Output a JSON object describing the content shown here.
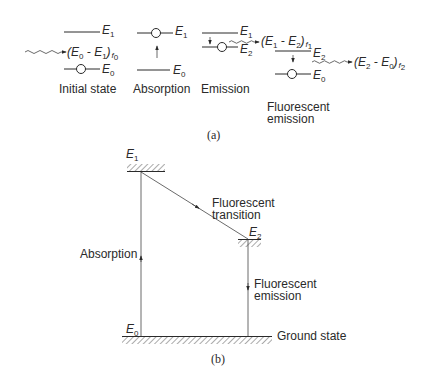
{
  "figure": {
    "panel_a": {
      "caption": "(a)",
      "stages": [
        {
          "label": "Initial state",
          "upper_level": "E",
          "upper_sub": "1",
          "lower_level": "E",
          "lower_sub": "0",
          "photon_label": {
            "open": "(",
            "e1": "E",
            "e1_sub": "0",
            "minus": " - ",
            "e2": "E",
            "e2_sub": "1",
            "close": ")",
            "f": "f",
            "f_sub": "0"
          }
        },
        {
          "label": "Absorption",
          "upper_level": "E",
          "upper_sub": "1",
          "lower_level": "E",
          "lower_sub": "0"
        },
        {
          "label": "Emission",
          "upper_level": "E",
          "upper_sub": "1",
          "lower_level": "E",
          "lower_sub": "2",
          "photon_label": {
            "open": "(",
            "e1": "E",
            "e1_sub": "1",
            "minus": " - ",
            "e2": "E",
            "e2_sub": "2",
            "close": ")",
            "f": "f",
            "f_sub": "1"
          }
        },
        {
          "label_line1": "Fluorescent",
          "label_line2": "emission",
          "upper_level": "E",
          "upper_sub": "2",
          "lower_level": "E",
          "lower_sub": "0",
          "photon_label": {
            "open": "(",
            "e1": "E",
            "e1_sub": "2",
            "minus": " - ",
            "e2": "E",
            "e2_sub": "0",
            "close": ")",
            "f": "f",
            "f_sub": "2"
          }
        }
      ]
    },
    "panel_b": {
      "caption": "(b)",
      "levels": {
        "e1": {
          "name": "E",
          "sub": "1"
        },
        "e2": {
          "name": "E",
          "sub": "2"
        },
        "e0": {
          "name": "E",
          "sub": "0"
        }
      },
      "labels": {
        "absorption": "Absorption",
        "transition_line1": "Fluorescent",
        "transition_line2": "transition",
        "emission_line1": "Fluorescent",
        "emission_line2": "emission",
        "ground": "Ground state"
      }
    },
    "colors": {
      "ink": "#2a2a2a",
      "background": "#ffffff"
    }
  }
}
